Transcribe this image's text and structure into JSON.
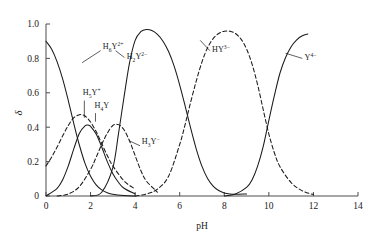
{
  "chart_data": {
    "type": "line",
    "title": "",
    "subtitle": "",
    "xlabel": "pH",
    "ylabel": "δ",
    "xlim": [
      0,
      14
    ],
    "ylim": [
      0,
      1.0
    ],
    "xticks": [
      0,
      2,
      4,
      6,
      8,
      10,
      12,
      14
    ],
    "xtick_labels": [
      "0",
      "2",
      "4",
      "6",
      "8",
      "10",
      "12",
      "14"
    ],
    "yticks": [
      0,
      0.2,
      0.4,
      0.6,
      0.8,
      1.0
    ],
    "ytick_labels": [
      "0",
      "0.2",
      "0.4",
      "0.6",
      "0.8",
      "1.0"
    ],
    "grid": false,
    "legend_position": "inline-annotations",
    "series": [
      {
        "name": "H6Y2+",
        "label_base": "H",
        "label_sub": "6",
        "label_mid": "Y",
        "label_sup": "2+",
        "style": "solid",
        "label_x": 2.55,
        "label_y": 0.855,
        "leader": [
          [
            2.45,
            0.845
          ],
          [
            1.62,
            0.775
          ]
        ],
        "x": [
          0.0,
          0.25,
          0.5,
          0.75,
          1.0,
          1.25,
          1.5,
          1.75,
          2.0,
          2.25,
          2.5,
          2.75,
          3.0,
          3.5,
          4.0
        ],
        "y": [
          0.9,
          0.855,
          0.78,
          0.68,
          0.555,
          0.42,
          0.295,
          0.19,
          0.115,
          0.065,
          0.036,
          0.019,
          0.01,
          0.003,
          0.0
        ]
      },
      {
        "name": "H5Y+",
        "label_base": "H",
        "label_sub": "5",
        "label_mid": "Y",
        "label_sup": "+",
        "style": "dashed",
        "label_x": 1.65,
        "label_y": 0.585,
        "leader": [
          [
            1.72,
            0.555
          ],
          [
            1.72,
            0.455
          ]
        ],
        "x": [
          0.0,
          0.25,
          0.5,
          0.75,
          1.0,
          1.25,
          1.5,
          1.6,
          1.75,
          2.0,
          2.25,
          2.5,
          2.75,
          3.0,
          3.5,
          4.0
        ],
        "y": [
          0.175,
          0.225,
          0.285,
          0.35,
          0.41,
          0.455,
          0.472,
          0.473,
          0.465,
          0.43,
          0.375,
          0.305,
          0.235,
          0.175,
          0.088,
          0.04
        ]
      },
      {
        "name": "H4Y",
        "label_base": "H",
        "label_sub": "4",
        "label_mid": "Y",
        "label_sup": "",
        "style": "solid",
        "label_x": 2.18,
        "label_y": 0.512,
        "leader": [
          [
            2.22,
            0.482
          ],
          [
            2.22,
            0.432
          ]
        ],
        "x": [
          0.0,
          0.5,
          0.75,
          1.0,
          1.25,
          1.5,
          1.75,
          1.9,
          2.0,
          2.25,
          2.5,
          2.75,
          3.0,
          3.25,
          3.5,
          4.0
        ],
        "y": [
          0.0,
          0.045,
          0.095,
          0.175,
          0.275,
          0.365,
          0.408,
          0.412,
          0.405,
          0.36,
          0.285,
          0.2,
          0.13,
          0.08,
          0.045,
          0.012
        ]
      },
      {
        "name": "H3Y-",
        "label_base": "H",
        "label_sub": "3",
        "label_mid": "Y",
        "label_sup": "−",
        "style": "dashed",
        "label_x": 4.3,
        "label_y": 0.302,
        "leader": [
          [
            4.22,
            0.292
          ],
          [
            3.72,
            0.322
          ]
        ],
        "x": [
          0.5,
          1.0,
          1.5,
          2.0,
          2.25,
          2.5,
          2.75,
          3.0,
          3.25,
          3.5,
          3.75,
          4.0,
          4.25,
          4.5,
          5.0
        ],
        "y": [
          0.0,
          0.012,
          0.055,
          0.155,
          0.225,
          0.3,
          0.365,
          0.41,
          0.415,
          0.385,
          0.32,
          0.235,
          0.15,
          0.088,
          0.022
        ]
      },
      {
        "name": "H2Y2-",
        "label_base": "H",
        "label_sub": "2",
        "label_mid": "Y",
        "label_sup": "2−",
        "style": "solid",
        "label_x": 3.62,
        "label_y": 0.795,
        "leader": [
          [
            3.52,
            0.805
          ],
          [
            3.12,
            0.845
          ]
        ],
        "x": [
          2.0,
          2.5,
          3.0,
          3.25,
          3.5,
          3.75,
          4.0,
          4.25,
          4.5,
          4.75,
          5.0,
          5.25,
          5.5,
          5.75,
          6.0,
          6.25,
          6.5,
          6.75,
          7.0,
          7.25,
          7.5,
          7.75,
          8.0,
          8.25,
          8.5,
          9.0
        ],
        "y": [
          0.0,
          0.022,
          0.165,
          0.36,
          0.575,
          0.775,
          0.905,
          0.955,
          0.968,
          0.962,
          0.94,
          0.9,
          0.84,
          0.755,
          0.645,
          0.52,
          0.39,
          0.27,
          0.172,
          0.102,
          0.058,
          0.032,
          0.018,
          0.012,
          0.01,
          0.012
        ]
      },
      {
        "name": "HY3-",
        "label_base": "H",
        "label_sub": "",
        "label_mid": "Y",
        "label_sup": "3−",
        "style": "dashed",
        "label_x": 7.45,
        "label_y": 0.835,
        "leader": [
          [
            7.35,
            0.845
          ],
          [
            6.92,
            0.905
          ]
        ],
        "x": [
          4.0,
          4.5,
          5.0,
          5.5,
          6.0,
          6.25,
          6.5,
          6.75,
          7.0,
          7.25,
          7.5,
          7.75,
          8.0,
          8.25,
          8.5,
          8.75,
          9.0,
          9.25,
          9.5,
          9.75,
          10.0,
          10.25,
          10.5,
          11.0,
          11.5,
          12.0
        ],
        "y": [
          0.0,
          0.012,
          0.04,
          0.115,
          0.3,
          0.42,
          0.55,
          0.672,
          0.78,
          0.862,
          0.915,
          0.945,
          0.958,
          0.958,
          0.945,
          0.912,
          0.855,
          0.765,
          0.645,
          0.5,
          0.36,
          0.25,
          0.17,
          0.078,
          0.03,
          0.008
        ]
      },
      {
        "name": "Y4-",
        "label_base": "",
        "label_sub": "",
        "label_mid": "Y",
        "label_sup": "4−",
        "style": "solid",
        "label_x": 11.6,
        "label_y": 0.79,
        "leader": [
          [
            11.5,
            0.8
          ],
          [
            10.75,
            0.83
          ]
        ],
        "x": [
          8.0,
          8.5,
          9.0,
          9.25,
          9.5,
          9.75,
          10.0,
          10.25,
          10.5,
          10.75,
          11.0,
          11.25,
          11.5,
          11.75
        ],
        "y": [
          0.0,
          0.012,
          0.05,
          0.095,
          0.175,
          0.29,
          0.44,
          0.585,
          0.715,
          0.805,
          0.868,
          0.908,
          0.932,
          0.942
        ]
      }
    ]
  },
  "colors": {
    "axis": "#4c4c4c",
    "curve": "#1a1a1a",
    "background": "#ffffff"
  }
}
